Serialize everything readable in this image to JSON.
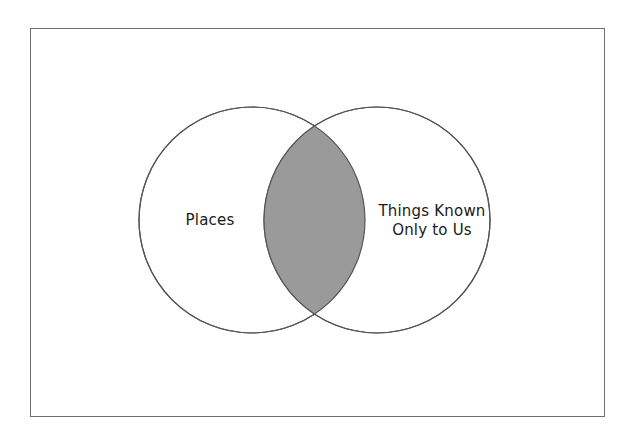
{
  "diagram": {
    "type": "venn",
    "title": "",
    "frame": {
      "border_color": "#6e6e6e",
      "background_color": "#ffffff"
    },
    "circles": [
      {
        "id": "left-circle",
        "name": "places-circle",
        "label": "Places",
        "label_lines": [
          "Places"
        ],
        "cx": 252,
        "cy": 220,
        "r": 113,
        "fill": "#ffffff",
        "stroke": "#555555"
      },
      {
        "id": "right-circle",
        "name": "things-known-circle",
        "label": "Things Known Only to Us",
        "label_lines": [
          "Things Known",
          "Only to Us"
        ],
        "cx": 377,
        "cy": 220,
        "r": 113,
        "fill": "#ffffff",
        "stroke": "#555555"
      }
    ],
    "intersection": {
      "name": "intersection-lens",
      "label": "",
      "fill": "#9a9a9a",
      "stroke": "#555555"
    }
  }
}
